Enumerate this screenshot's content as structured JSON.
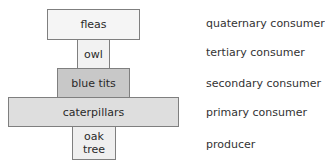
{
  "diagram": {
    "type": "pyramid of numbers",
    "levels": [
      {
        "organism": "fleas",
        "trophic_level": "quaternary consumer",
        "fill": "#f5f5f5"
      },
      {
        "organism": "owl",
        "trophic_level": "tertiary consumer",
        "fill": "#f2f2f2"
      },
      {
        "organism": "blue tits",
        "trophic_level": "secondary consumer",
        "fill": "#c8c8c8"
      },
      {
        "organism": "caterpillars",
        "trophic_level": "primary consumer",
        "fill": "#dedede"
      },
      {
        "organism": "oak tree",
        "organism_lines": [
          "oak",
          "tree"
        ],
        "trophic_level": "producer",
        "fill": "#efefef"
      }
    ]
  }
}
